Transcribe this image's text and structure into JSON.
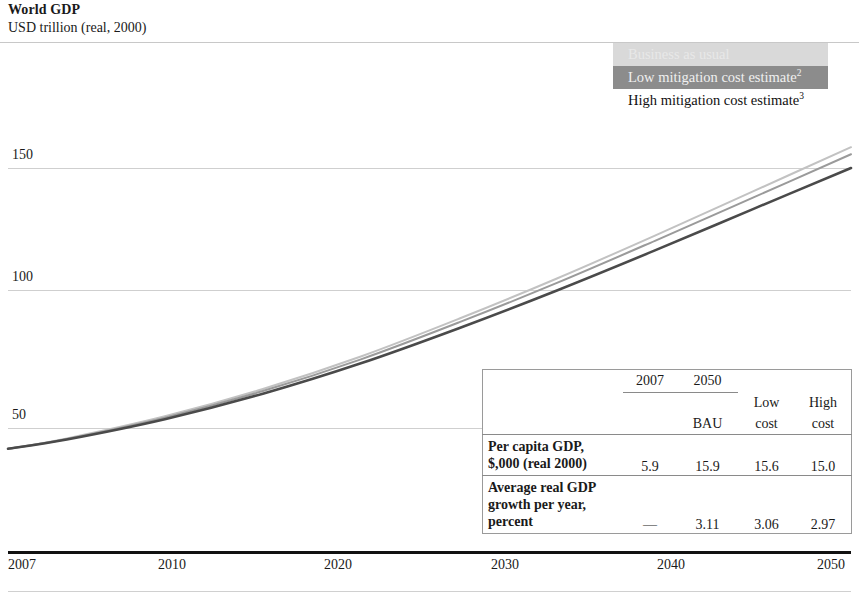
{
  "header": {
    "title": "World GDP",
    "subtitle": "USD trillion (real, 2000)"
  },
  "legend": {
    "items": [
      {
        "label": "Business as usual",
        "swatch": "#d9d9d9",
        "text_color": "#e8e8e8"
      },
      {
        "label": "Low mitigation cost estimate",
        "superscript": "2",
        "swatch": "#8c8c8c",
        "text_color": "#f0f0f0"
      },
      {
        "label": "High mitigation cost estimate",
        "superscript": "3",
        "swatch": "#ffffff",
        "text_color": "#111111"
      }
    ]
  },
  "axes": {
    "y_ticks": [
      "50",
      "100",
      "150"
    ],
    "x_ticks": [
      "2007",
      "2010",
      "2020",
      "2030",
      "2040",
      "2050"
    ]
  },
  "table": {
    "header": {
      "year_2007": "2007",
      "year_2050": "2050",
      "bau": "BAU",
      "low_1": "Low",
      "low_2": "cost",
      "high_1": "High",
      "high_2": "cost"
    },
    "rows": [
      {
        "label_line1": "Per capita GDP,",
        "label_line2": "$,000 (real 2000)",
        "label_line3": "",
        "v2007": "5.9",
        "bau": "15.9",
        "low": "15.6",
        "high": "15.0"
      },
      {
        "label_line1": "Average real GDP",
        "label_line2": "growth per year,",
        "label_line3": "percent",
        "v2007": "—",
        "bau": "3.11",
        "low": "3.06",
        "high": "2.97"
      }
    ]
  },
  "chart_data": {
    "type": "line",
    "title": "World GDP",
    "ylabel": "USD trillion (real, 2000)",
    "xlabel": "",
    "xlim": [
      2007,
      2050
    ],
    "ylim": [
      0,
      160
    ],
    "yticks": [
      50,
      100,
      150
    ],
    "xticks": [
      2007,
      2010,
      2020,
      2030,
      2040,
      2050
    ],
    "grid": true,
    "legend_position": "top-right",
    "x": [
      2007,
      2010,
      2015,
      2020,
      2025,
      2030,
      2035,
      2040,
      2045,
      2050
    ],
    "series": [
      {
        "name": "Business as usual",
        "color": "#c2c2c2",
        "values": [
          42.0,
          46.0,
          54.5,
          65.0,
          77.5,
          92.0,
          107.5,
          124.0,
          141.0,
          158.0
        ]
      },
      {
        "name": "Low mitigation cost estimate",
        "color": "#9a9a9a",
        "values": [
          42.0,
          45.8,
          54.0,
          64.2,
          76.4,
          90.6,
          105.8,
          122.0,
          138.6,
          155.3
        ]
      },
      {
        "name": "High mitigation cost estimate",
        "color": "#4a4a4a",
        "values": [
          42.0,
          45.6,
          53.4,
          63.2,
          74.9,
          88.4,
          102.9,
          118.3,
          134.2,
          150.0
        ]
      }
    ]
  }
}
